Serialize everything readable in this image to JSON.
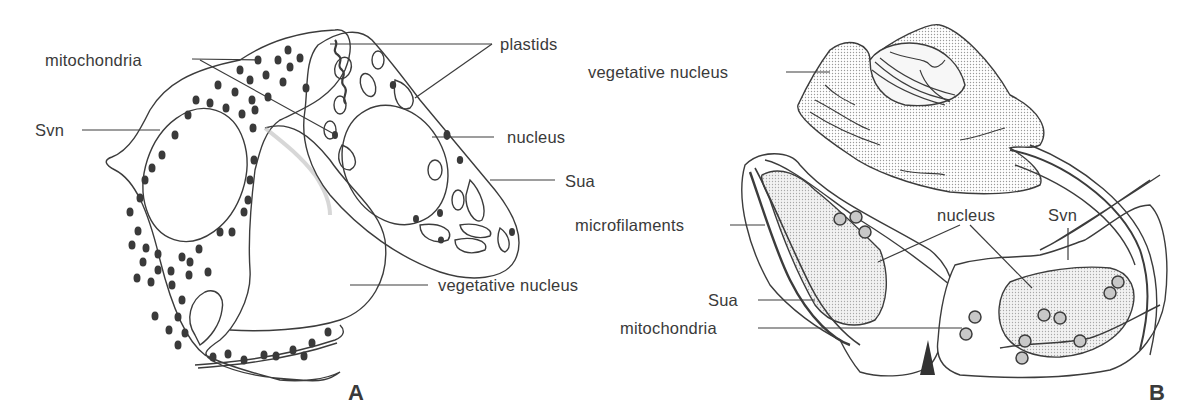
{
  "panels": [
    {
      "id": "A",
      "letter": "A",
      "labels": {
        "mitochondria": "mitochondria",
        "plastids": "plastids",
        "svn": "Svn",
        "nucleus": "nucleus",
        "sua": "Sua",
        "vegetative_nucleus": "vegetative nucleus"
      }
    },
    {
      "id": "B",
      "letter": "B",
      "labels": {
        "vegetative_nucleus": "vegetative nucleus",
        "microfilaments": "microfilaments",
        "nucleus": "nucleus",
        "svn": "Svn",
        "sua": "Sua",
        "mitochondria": "mitochondria"
      }
    }
  ],
  "colors": {
    "line": "#3c3c3c",
    "stipple": "#d9d9d9",
    "organelle": "#3a3a3a"
  }
}
